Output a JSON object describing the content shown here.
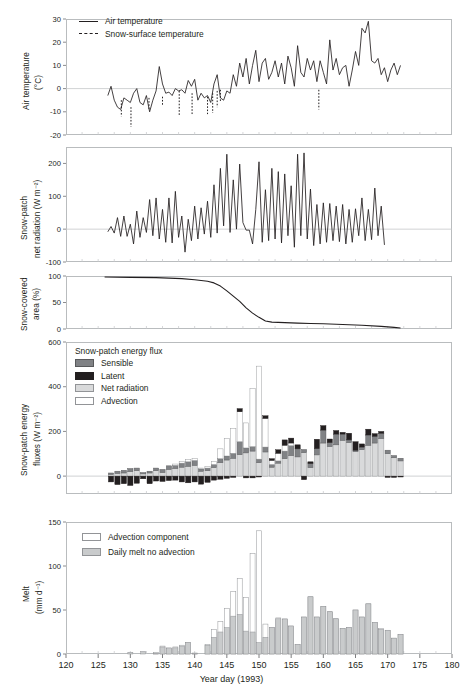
{
  "figure": {
    "xaxis": {
      "title": "Year day (1993)",
      "min": 120,
      "max": 180,
      "ticks": [
        120,
        125,
        130,
        135,
        140,
        145,
        150,
        155,
        160,
        165,
        170,
        175,
        180
      ],
      "minor_step": 2.5
    },
    "colors": {
      "line": "#231f20",
      "frame": "#b9bcbe",
      "sensible": "#808285",
      "latent": "#231f20",
      "net_radiation": "#d9dadb",
      "advection": "#ffffff",
      "melt_bar": "#c9cbcc",
      "advection_bar": "#ffffff"
    }
  },
  "chart_data": [
    {
      "panel": 1,
      "type": "line",
      "title": "",
      "ylabel": "Air temperature (°C)",
      "ylabel_line1": "Air temperature",
      "ylabel_line2": "(°C)",
      "xlabel": "",
      "ylim": [
        -20,
        30
      ],
      "yticks": [
        30,
        20,
        10,
        0,
        -10,
        -20
      ],
      "xlim": [
        120,
        180
      ],
      "grid": false,
      "legend_position": "top-left",
      "legend": [
        {
          "label": "Air temperature",
          "style": "solid-line"
        },
        {
          "label": "Snow-surface temperature",
          "style": "dashed-line"
        }
      ],
      "series": [
        {
          "name": "Air temperature",
          "style": "solid",
          "x": [
            126.5,
            127,
            127.5,
            128,
            128.5,
            129,
            129.5,
            130,
            130.5,
            131,
            131.5,
            132,
            132.5,
            133,
            133.5,
            134,
            134.5,
            135,
            135.5,
            136,
            136.5,
            137,
            137.5,
            138,
            138.5,
            139,
            139.5,
            140,
            140.5,
            141,
            141.5,
            142,
            142.5,
            143,
            143.5,
            144,
            144.5,
            145,
            145.5,
            146,
            146.5,
            147,
            147.5,
            148,
            148.5,
            149,
            149.5,
            150,
            150.5,
            151,
            151.5,
            152,
            152.5,
            153,
            153.5,
            154,
            154.5,
            155,
            155.5,
            156,
            156.5,
            157,
            157.5,
            158,
            158.5,
            159,
            159.5,
            160,
            160.5,
            161,
            161.5,
            162,
            162.5,
            163,
            163.5,
            164,
            164.5,
            165,
            165.5,
            166,
            166.5,
            167,
            167.5,
            168,
            168.5,
            169,
            169.5,
            170,
            170.5,
            171,
            171.5,
            172
          ],
          "y": [
            -3,
            1,
            -5,
            -8,
            -9,
            -4,
            -5,
            -6,
            -2,
            0,
            -6,
            -7,
            -3,
            -10,
            -5,
            -1,
            9.5,
            2,
            -2,
            -1.5,
            -3,
            0,
            -1,
            -0.5,
            -2,
            3.5,
            1,
            4,
            -5,
            -2,
            -4,
            -3,
            -6,
            2,
            6,
            -4,
            -5,
            -1,
            -2,
            6,
            1,
            11,
            5,
            13,
            2,
            10,
            16.5,
            3,
            11,
            13,
            4,
            7,
            12,
            5,
            11,
            2,
            14,
            9,
            1,
            18.5,
            7,
            5,
            13,
            8,
            12,
            3,
            12,
            7,
            2,
            21,
            8,
            13,
            6,
            9,
            10,
            1,
            8,
            16,
            10,
            26,
            24,
            29,
            12,
            11,
            13,
            6,
            9,
            3,
            8,
            11,
            6,
            10
          ]
        },
        {
          "name": "Snow-surface temperature",
          "style": "dashed",
          "segments": [
            {
              "x": [
                128.6,
                128.6
              ],
              "y": [
                -5,
                -12
              ]
            },
            {
              "x": [
                130.1,
                130.1
              ],
              "y": [
                -8,
                -16.5
              ]
            },
            {
              "x": [
                132.9,
                132.9
              ],
              "y": [
                -4,
                -9
              ]
            },
            {
              "x": [
                135.0,
                135.0
              ],
              "y": [
                -3.5,
                -7
              ]
            },
            {
              "x": [
                137.6,
                137.6
              ],
              "y": [
                -1,
                -11.5
              ]
            },
            {
              "x": [
                139.6,
                139.6
              ],
              "y": [
                -2,
                -11.5
              ]
            },
            {
              "x": [
                142.0,
                142.0
              ],
              "y": [
                -3.5,
                -11
              ]
            },
            {
              "x": [
                142.8,
                142.8
              ],
              "y": [
                -2,
                -10.5
              ]
            },
            {
              "x": [
                143.5,
                143.5
              ],
              "y": [
                -1,
                -8
              ]
            },
            {
              "x": [
                144.0,
                144.0
              ],
              "y": [
                -0.5,
                -6
              ]
            },
            {
              "x": [
                159.3,
                159.3
              ],
              "y": [
                -0.5,
                -9
              ]
            }
          ]
        }
      ]
    },
    {
      "panel": 2,
      "type": "line",
      "ylabel": "Snow-patch net radiation (W m⁻²)",
      "ylabel_line1": "Snow-patch",
      "ylabel_line2": "net radiation (W m⁻²)",
      "ylim": [
        -100,
        250
      ],
      "yticks": [
        200,
        100,
        0,
        -100
      ],
      "xlim": [
        120,
        180
      ],
      "grid": false,
      "series": [
        {
          "name": "Snow-patch net radiation",
          "style": "solid",
          "x": [
            126.5,
            127,
            127.5,
            128,
            128.5,
            129,
            129.5,
            130,
            130.5,
            131,
            131.5,
            132,
            132.5,
            133,
            133.5,
            134,
            134.5,
            135,
            135.5,
            136,
            136.5,
            137,
            137.5,
            138,
            138.5,
            139,
            139.5,
            140,
            140.5,
            141,
            141.5,
            142,
            142.5,
            143,
            143.5,
            144,
            144.5,
            145,
            145.5,
            146,
            146.5,
            147,
            147.5,
            148,
            148.5,
            149,
            149.5,
            150,
            150.5,
            151,
            151.5,
            152,
            152.5,
            153,
            153.5,
            154,
            154.5,
            155,
            155.5,
            156,
            156.5,
            157,
            157.5,
            158,
            158.5,
            159,
            159.5,
            160,
            160.5,
            161,
            161.5,
            162,
            162.5,
            163,
            163.5,
            164,
            164.5,
            165,
            165.5,
            166,
            166.5,
            167,
            167.5,
            168,
            168.5,
            169,
            169.5,
            170,
            170.5,
            171,
            171.5,
            172
          ],
          "y": [
            -8,
            8,
            -12,
            35,
            -22,
            40,
            -22,
            15,
            -45,
            55,
            -25,
            35,
            -10,
            90,
            -20,
            95,
            -30,
            60,
            -40,
            95,
            -42,
            115,
            -25,
            40,
            -70,
            30,
            -35,
            70,
            -30,
            65,
            -15,
            85,
            -25,
            135,
            -12,
            185,
            10,
            228,
            -10,
            150,
            0,
            198,
            20,
            -3,
            -3,
            -45,
            60,
            205,
            -40,
            120,
            -35,
            185,
            -30,
            175,
            -42,
            168,
            -20,
            132,
            -55,
            228,
            -20,
            232,
            -30,
            122,
            -50,
            75,
            -45,
            80,
            -40,
            78,
            -35,
            70,
            -38,
            75,
            -45,
            60,
            -40,
            62,
            -20,
            95,
            -35,
            60,
            -32,
            125,
            -20,
            70,
            -48
          ]
        }
      ]
    },
    {
      "panel": 3,
      "type": "line",
      "ylabel": "Snow-covered area (%)",
      "ylabel_line1": "Snow-covered",
      "ylabel_line2": "area (%)",
      "ylim": [
        0,
        100
      ],
      "yticks": [
        100,
        50,
        0
      ],
      "xlim": [
        120,
        180
      ],
      "grid": false,
      "series": [
        {
          "name": "Snow-covered area",
          "style": "solid",
          "x": [
            126,
            130,
            134,
            138,
            140,
            142,
            143,
            144,
            145,
            146,
            147,
            148,
            149,
            150,
            151,
            152,
            153,
            154,
            156,
            158,
            160,
            163,
            166,
            169,
            171,
            172
          ],
          "y": [
            98,
            97.5,
            97,
            95,
            93,
            90,
            87,
            81,
            72,
            62,
            52,
            40,
            30,
            22,
            15,
            13,
            12.5,
            12,
            11,
            10.5,
            10,
            8.5,
            7,
            5,
            3,
            2
          ]
        }
      ]
    },
    {
      "panel": 4,
      "type": "bar",
      "stacked": true,
      "ylabel": "Snow-patch energy fluxes (W m⁻²)",
      "ylabel_line1": "Snow-patch energy",
      "ylabel_line2": "fluxes (W m⁻²)",
      "ylim": [
        -80,
        600
      ],
      "yticks": [
        600,
        400,
        200,
        0
      ],
      "xlim": [
        120,
        180
      ],
      "grid": false,
      "legend_position": "top-left",
      "legend_title": "Snow-patch energy flux",
      "legend": [
        {
          "label": "Sensible",
          "swatch": "sensible"
        },
        {
          "label": "Latent",
          "swatch": "latent"
        },
        {
          "label": "Net radiation",
          "swatch": "net_radiation"
        },
        {
          "label": "Advection",
          "swatch": "advection"
        }
      ],
      "categories": [
        127,
        128,
        129,
        130,
        131,
        132,
        133,
        134,
        135,
        136,
        137,
        138,
        139,
        140,
        141,
        142,
        143,
        144,
        145,
        146,
        147,
        148,
        149,
        150,
        151,
        152,
        153,
        154,
        155,
        156,
        157,
        158,
        159,
        160,
        161,
        162,
        163,
        164,
        165,
        166,
        167,
        168,
        169,
        170,
        171,
        172
      ],
      "series": [
        {
          "name": "Net radiation",
          "values": [
            8,
            12,
            14,
            20,
            24,
            10,
            14,
            24,
            16,
            30,
            34,
            40,
            44,
            48,
            22,
            24,
            38,
            60,
            72,
            80,
            96,
            104,
            112,
            60,
            108,
            40,
            58,
            78,
            92,
            86,
            105,
            38,
            95,
            148,
            132,
            140,
            160,
            150,
            110,
            118,
            138,
            148,
            168,
            100,
            82,
            68
          ]
        },
        {
          "name": "Sensible",
          "values": [
            6,
            10,
            12,
            14,
            12,
            6,
            8,
            12,
            14,
            16,
            14,
            18,
            20,
            22,
            10,
            12,
            14,
            18,
            18,
            22,
            58,
            22,
            20,
            16,
            22,
            12,
            10,
            34,
            44,
            36,
            14,
            18,
            28,
            58,
            18,
            48,
            28,
            12,
            6,
            12,
            46,
            30,
            24,
            16,
            10,
            12
          ]
        },
        {
          "name": "Latent",
          "values": [
            -26,
            -38,
            -34,
            -42,
            -32,
            -12,
            -34,
            -22,
            -24,
            -20,
            -18,
            -26,
            -30,
            -26,
            -36,
            -28,
            -18,
            -14,
            -10,
            -6,
            14,
            -8,
            -8,
            -4,
            12,
            8,
            16,
            24,
            22,
            18,
            -16,
            8,
            42,
            20,
            16,
            16,
            8,
            30,
            38,
            14,
            26,
            12,
            8,
            -6,
            -6,
            -4
          ]
        },
        {
          "name": "Advection",
          "values": [
            0,
            0,
            0,
            0,
            0,
            0,
            0,
            0,
            0,
            0,
            6,
            8,
            10,
            10,
            4,
            6,
            14,
            44,
            78,
            110,
            134,
            112,
            260,
            416,
            128,
            18,
            34,
            26,
            12,
            0,
            0,
            0,
            0,
            0,
            0,
            0,
            0,
            0,
            0,
            0,
            0,
            0,
            0,
            0,
            0,
            0
          ]
        }
      ]
    },
    {
      "panel": 5,
      "type": "bar",
      "grouped": true,
      "ylabel": "Melt (mm d⁻¹)",
      "ylabel_line1": "Melt",
      "ylabel_line2": "(mm d⁻¹)",
      "ylim": [
        0,
        150
      ],
      "yticks": [
        150,
        100,
        50,
        0
      ],
      "xlim": [
        120,
        180
      ],
      "grid": false,
      "legend_position": "top-left",
      "legend": [
        {
          "label": "Advection component",
          "swatch": "advection_bar"
        },
        {
          "label": "Daily melt no advection",
          "swatch": "melt_bar"
        }
      ],
      "categories": [
        130,
        131,
        132,
        133,
        134,
        135,
        136,
        137,
        138,
        139,
        140,
        141,
        142,
        143,
        144,
        145,
        146,
        147,
        148,
        149,
        150,
        151,
        152,
        153,
        154,
        155,
        156,
        157,
        158,
        159,
        160,
        161,
        162,
        163,
        164,
        165,
        166,
        167,
        168,
        169,
        170,
        171,
        172
      ],
      "series": [
        {
          "name": "Advection component",
          "values": [
            0,
            0,
            0,
            0,
            2,
            9,
            7,
            8,
            10,
            13,
            1,
            0,
            11,
            28,
            37,
            52,
            71,
            86,
            64,
            114,
            140,
            34,
            30,
            41,
            40,
            32,
            11,
            42,
            65,
            42,
            54,
            48,
            40,
            29,
            30,
            50,
            42,
            57,
            36,
            29,
            27,
            18,
            22
          ]
        },
        {
          "name": "Daily melt no advection",
          "values": [
            2,
            0,
            3,
            0,
            1,
            8,
            6,
            7,
            9,
            13,
            1,
            0,
            10,
            19,
            25,
            30,
            43,
            45,
            26,
            25,
            13,
            19,
            30,
            40,
            39,
            31,
            11,
            42,
            65,
            42,
            54,
            48,
            40,
            29,
            30,
            50,
            42,
            57,
            36,
            28,
            27,
            18,
            22
          ]
        }
      ]
    }
  ]
}
